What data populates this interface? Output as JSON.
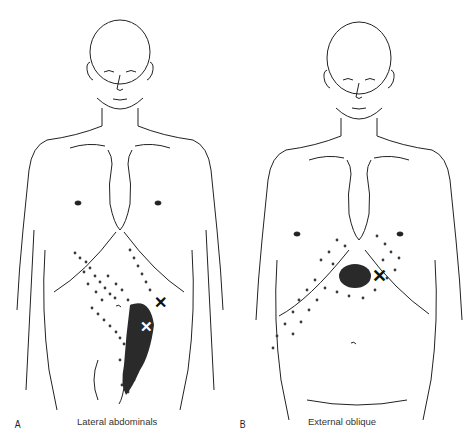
{
  "figures": [
    {
      "panel": "A",
      "caption": "Lateral abdominals",
      "markers": [
        {
          "type": "trigger-point",
          "color": "#111111",
          "symbol": "✕"
        },
        {
          "type": "trigger-point",
          "color": "#ffffff",
          "symbol": "✕"
        }
      ]
    },
    {
      "panel": "B",
      "caption": "External oblique",
      "markers": [
        {
          "type": "trigger-point",
          "color": "#111111",
          "symbol": "✕"
        }
      ]
    }
  ],
  "colors": {
    "line": "#222222",
    "stipple": "#3a3a3a",
    "essential_zone": "#2a2a2a",
    "background": "#ffffff"
  }
}
